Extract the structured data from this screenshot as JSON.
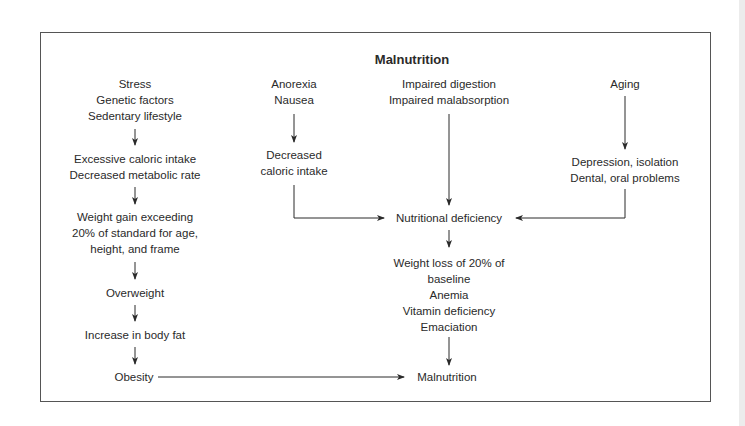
{
  "title": "Malnutrition",
  "nodes": {
    "stress": [
      "Stress",
      "Genetic factors",
      "Sedentary lifestyle"
    ],
    "excess": [
      "Excessive caloric intake",
      "Decreased metabolic rate"
    ],
    "gain": [
      "Weight gain exceeding",
      "20% of standard for age,",
      "height, and frame"
    ],
    "overweight": [
      "Overweight"
    ],
    "bodyfat": [
      "Increase in body fat"
    ],
    "obesity": [
      "Obesity"
    ],
    "anorexia": [
      "Anorexia",
      "Nausea"
    ],
    "decreased": [
      "Decreased",
      "caloric intake"
    ],
    "digestion": [
      "Impaired digestion",
      "Impaired malabsorption"
    ],
    "aging": [
      "Aging"
    ],
    "depression": [
      "Depression, isolation",
      "Dental, oral problems"
    ],
    "deficiency": [
      "Nutritional deficiency"
    ],
    "loss": [
      "Weight loss of 20% of",
      "baseline",
      "Anemia",
      "Vitamin deficiency",
      "Emaciation"
    ],
    "malnutrition": [
      "Malnutrition"
    ]
  },
  "colors": {
    "line": "#2a2a2a",
    "border": "#555555"
  }
}
